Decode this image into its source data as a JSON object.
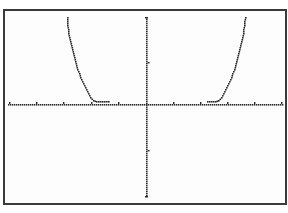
{
  "chart_data": {
    "type": "scatter",
    "title": "",
    "xlabel": "",
    "ylabel": "",
    "style": "dotted calculator-style plot",
    "grid": false,
    "legend": null,
    "x_axis": {
      "pixel_y": 104,
      "pixel_x_range": [
        8,
        282
      ],
      "ticks_px": [
        9,
        36,
        63,
        91,
        118,
        173,
        200,
        227,
        254,
        281
      ]
    },
    "y_axis": {
      "pixel_x": 146,
      "pixel_y_range": [
        17,
        196
      ],
      "ticks_px": [
        62,
        150
      ]
    },
    "series": [
      {
        "name": "left branch",
        "points_px": [
          [
            67,
            17
          ],
          [
            67,
            21
          ],
          [
            67,
            25
          ],
          [
            68,
            29
          ],
          [
            68,
            33
          ],
          [
            69,
            37
          ],
          [
            70,
            41
          ],
          [
            71,
            45
          ],
          [
            72,
            49
          ],
          [
            73,
            53
          ],
          [
            74,
            57
          ],
          [
            75,
            61
          ],
          [
            76,
            65
          ],
          [
            77,
            69
          ],
          [
            79,
            73
          ],
          [
            80,
            77
          ],
          [
            82,
            81
          ],
          [
            84,
            85
          ],
          [
            86,
            89
          ],
          [
            88,
            93
          ],
          [
            90,
            97
          ],
          [
            93,
            100
          ],
          [
            96,
            101
          ],
          [
            100,
            101
          ],
          [
            104,
            101
          ],
          [
            108,
            101
          ]
        ]
      },
      {
        "name": "right branch",
        "points_px": [
          [
            207,
            101
          ],
          [
            211,
            101
          ],
          [
            215,
            101
          ],
          [
            218,
            100
          ],
          [
            221,
            97
          ],
          [
            223,
            93
          ],
          [
            225,
            89
          ],
          [
            227,
            85
          ],
          [
            229,
            81
          ],
          [
            231,
            77
          ],
          [
            232,
            73
          ],
          [
            234,
            69
          ],
          [
            235,
            65
          ],
          [
            236,
            61
          ],
          [
            237,
            57
          ],
          [
            238,
            53
          ],
          [
            239,
            49
          ],
          [
            240,
            45
          ],
          [
            241,
            41
          ],
          [
            242,
            37
          ],
          [
            243,
            33
          ],
          [
            243,
            29
          ],
          [
            244,
            25
          ],
          [
            244,
            21
          ],
          [
            245,
            17
          ]
        ]
      }
    ],
    "colors": {
      "curve": "#2a2a2a",
      "axis": "#2a2a2a",
      "frame": "#3a3a3a",
      "background": "#fdfdfd"
    }
  },
  "labels": {
    "chart_description": "Plot of an even, U-shaped function with two steep branches and flat section near the x-axis"
  }
}
